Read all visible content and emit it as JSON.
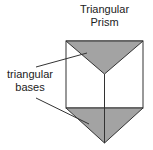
{
  "diagram": {
    "title_line1": "Triangular",
    "title_line2": "Prism",
    "label_line1": "triangular",
    "label_line2": "bases",
    "colors": {
      "base_fill": "#a3a3a3",
      "stroke": "#333333",
      "face_fill": "#ffffff"
    }
  }
}
